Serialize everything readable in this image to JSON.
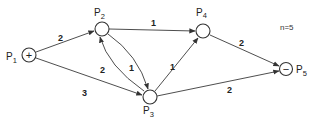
{
  "diagram": {
    "type": "directed-weighted-graph",
    "note": "n=5",
    "nodes": [
      {
        "id": "P1",
        "label": "P",
        "sub": "1",
        "symbol": "+",
        "role": "source"
      },
      {
        "id": "P2",
        "label": "P",
        "sub": "2",
        "symbol": "",
        "role": "intermediate"
      },
      {
        "id": "P3",
        "label": "P",
        "sub": "3",
        "symbol": "",
        "role": "intermediate"
      },
      {
        "id": "P4",
        "label": "P",
        "sub": "4",
        "symbol": "",
        "role": "intermediate"
      },
      {
        "id": "P5",
        "label": "P",
        "sub": "5",
        "symbol": "−",
        "role": "sink"
      }
    ],
    "edges": [
      {
        "from": "P1",
        "to": "P2",
        "weight": "2"
      },
      {
        "from": "P1",
        "to": "P3",
        "weight": "3"
      },
      {
        "from": "P2",
        "to": "P4",
        "weight": "1"
      },
      {
        "from": "P3",
        "to": "P2",
        "weight": "2"
      },
      {
        "from": "P2",
        "to": "P3",
        "weight": "1"
      },
      {
        "from": "P3",
        "to": "P4",
        "weight": "1"
      },
      {
        "from": "P4",
        "to": "P5",
        "weight": "2"
      },
      {
        "from": "P3",
        "to": "P5",
        "weight": "2"
      }
    ]
  }
}
